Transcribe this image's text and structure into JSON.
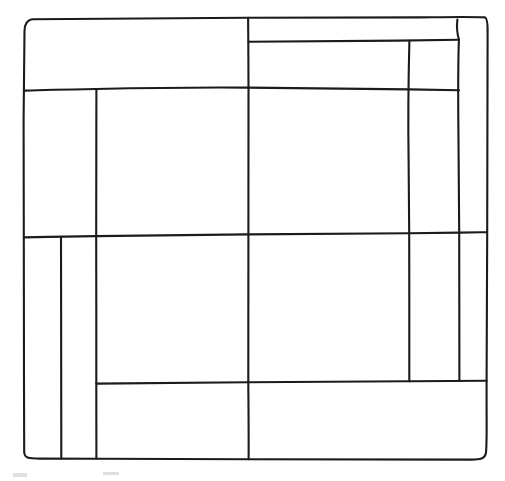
{
  "document": {
    "title": "Hand-drawn patchwork grid",
    "description": "A freehand line drawing of a rectangular frame subdivided into irregular rectangular panels, resembling a quilt block or architectural floor-plan sketch.",
    "canvas": {
      "width": 505,
      "height": 481,
      "background_color": "#ffffff"
    },
    "style": {
      "stroke_color": "#1b1b1b",
      "stroke_width": 2.1,
      "fill": "none",
      "line_quality": "hand-drawn / wobbly"
    }
  },
  "geometry": {
    "outer_frame": {
      "name": "outer-border",
      "top_left": [
        23,
        19
      ],
      "top_right": [
        487,
        17
      ],
      "bottom_right": [
        486,
        460
      ],
      "bottom_left": [
        24,
        458
      ]
    },
    "vertical_guides": {
      "left_edge_x": 24,
      "inner_left_strip_a_x": 61,
      "inner_left_strip_b_x": 96,
      "center_x": 248,
      "inner_right_strip_a_x": 409,
      "inner_right_strip_b_x": 459,
      "right_edge_x": 486
    },
    "horizontal_guides": {
      "top_edge_y": 18,
      "top_thin_band_y": 42,
      "upper_band_y": 90,
      "center_y": 236,
      "lower_band_y": 383,
      "bottom_edge_y": 459
    },
    "panels": [
      {
        "name": "panel-top-left-wide",
        "bounds": [
          23,
          18,
          248,
          90
        ]
      },
      {
        "name": "panel-top-right-thin-strip",
        "bounds": [
          248,
          17,
          459,
          42
        ]
      },
      {
        "name": "panel-upper-left-small",
        "bounds": [
          23,
          90,
          96,
          236
        ]
      },
      {
        "name": "panel-upper-center-left",
        "bounds": [
          96,
          90,
          248,
          236
        ]
      },
      {
        "name": "panel-upper-center-right",
        "bounds": [
          248,
          42,
          409,
          236
        ]
      },
      {
        "name": "panel-upper-right-tall",
        "bounds": [
          409,
          42,
          459,
          383
        ]
      },
      {
        "name": "panel-right-edge-strip",
        "bounds": [
          459,
          17,
          486,
          232
        ]
      },
      {
        "name": "panel-lower-left-strip-a",
        "bounds": [
          24,
          236,
          61,
          458
        ]
      },
      {
        "name": "panel-lower-left-strip-b",
        "bounds": [
          61,
          236,
          96,
          458
        ]
      },
      {
        "name": "panel-lower-center-left",
        "bounds": [
          96,
          236,
          248,
          383
        ]
      },
      {
        "name": "panel-lower-center-right",
        "bounds": [
          248,
          236,
          409,
          383
        ]
      },
      {
        "name": "panel-bottom-left",
        "bounds": [
          96,
          383,
          248,
          458
        ]
      },
      {
        "name": "panel-bottom-right",
        "bounds": [
          248,
          383,
          486,
          459
        ]
      },
      {
        "name": "panel-right-lower",
        "bounds": [
          459,
          232,
          486,
          383
        ]
      }
    ],
    "paths": {
      "outer_border": "M 24.5 31 C 24.2 25.5 27 19.5 33 19.2 L 248 17.8 L 420 17.4 C 452 17.0 470 16.6 485 17.4 C 487.4 18.4 487.8 24 487.6 34 L 487.2 232 L 486.6 381 C 486.4 420 487.2 440 486.0 452.5 C 485.2 459 480 459.8 470 459.6 L 248 459.2 L 100 458.8 L 40 458.6 C 28 458.5 24.4 458 24.2 452 L 24.0 383 L 23.8 237 L 23.6 120 Z",
      "h_top_thin_band": "M 248.5 41.8 C 300 41.4 350 41.0 398 40.6 C 420 40.4 440 40.2 458.8 39.8",
      "h_upper_band": "M 24.4 90.6 C 48 89.8 72 89.4 96 89.0 C 150 87.8 200 87.2 248 87.6 C 310 88.2 360 88.8 409 89.4 C 428 89.7 444 89.9 459 90.2",
      "h_center": "M 23.9 237.4 C 48 236.9 72 236.5 96.2 236.1 C 150 235.2 200 234.6 248.2 234.4 C 310 234.1 360 233.6 409.2 233.2 C 430 233.0 450 232.8 459.2 232.6 C 470 232.5 478 232.4 486.6 232.2",
      "h_lower_band": "M 96.3 383.6 C 150 382.9 200 382.4 248.3 382.2 C 310 381.9 360 381.6 409.3 381.3 C 430 381.2 450 381.0 486.5 380.8",
      "v_center": "M 248.1 17.8 L 248.3 41.8 L 248.5 87.6 L 248.4 234.4 L 248.3 382.2 C 248.5 410 248.8 435 248.6 459.2",
      "v_left_strip_a": "M 61.0 237.1 L 61.1 300 L 61.2 380 C 61.3 410 61.4 435 61.3 458.6",
      "v_left_strip_b": "M 96.4 89.0 L 96.3 160 L 96.2 236.1 L 96.3 310 L 96.3 383.6 C 96.4 410 96.5 435 96.4 458.7",
      "v_right_strip_a": "M 409.4 40.8 C 408.4 80 408.0 120 408.6 160 C 409.0 200 409.2 220 409.2 233.2 L 409.3 300 L 409.3 381.3",
      "v_right_strip_b": "M 458.9 39.6 C 458.2 60 458.0 90 458.4 130 C 458.8 175 459.1 210 459.2 232.6 L 459.3 300 L 459.4 380.9",
      "v_right_corner_notch": "M 458.9 39.6 C 457.0 33 456.6 26 457.4 19.5"
    },
    "artifacts": [
      {
        "name": "faint-mark-left",
        "x": 13,
        "y": 473,
        "width": 14,
        "height": 4,
        "color": "#dfdfdf"
      },
      {
        "name": "faint-mark-right",
        "x": 103,
        "y": 472,
        "width": 16,
        "height": 3,
        "color": "#e4e4e4"
      }
    ]
  }
}
